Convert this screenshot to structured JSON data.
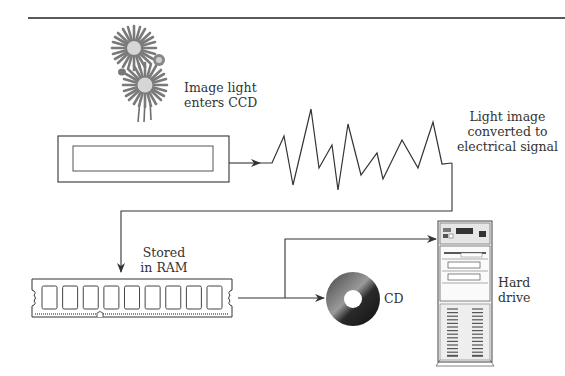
{
  "labels": {
    "image_light": [
      "Image light",
      "enters CCD"
    ],
    "converted": [
      "Light image",
      "converted to",
      "electrical signal"
    ],
    "stored": [
      "Stored",
      "in RAM"
    ],
    "cd": "CD",
    "hard_drive": [
      "Hard",
      "drive"
    ]
  },
  "colors": {
    "line": "#3a3a3a",
    "petal": "#7a7a7a",
    "flower_center": "#d6d6d6",
    "cd_dark": "#2b2b2b",
    "tower_face": "#f2f2f2",
    "vent": "#555555"
  },
  "diagram": {
    "stages": [
      "flower",
      "ccd-sensor",
      "analog-signal",
      "ram-module",
      "cd-disc",
      "hard-drive-tower"
    ],
    "ram_chip_count": 9,
    "waveform_points": [
      [
        260,
        163
      ],
      [
        272,
        163
      ],
      [
        284,
        136
      ],
      [
        293,
        185
      ],
      [
        311,
        109
      ],
      [
        319,
        168
      ],
      [
        332,
        145
      ],
      [
        338,
        190
      ],
      [
        348,
        124
      ],
      [
        361,
        175
      ],
      [
        377,
        153
      ],
      [
        383,
        179
      ],
      [
        402,
        140
      ],
      [
        418,
        168
      ],
      [
        433,
        122
      ],
      [
        442,
        164
      ],
      [
        452,
        163
      ]
    ]
  }
}
